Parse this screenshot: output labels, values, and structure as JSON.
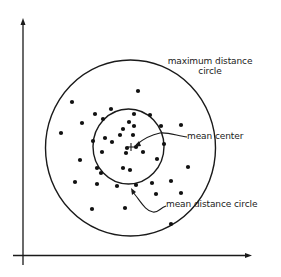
{
  "diagram": {
    "type": "spatial-statistics illustration",
    "axes": {
      "y_axis": {
        "x": 23,
        "top": 18,
        "bottom": 265
      },
      "x_axis": {
        "y": 255.5,
        "left": 13,
        "right": 252
      }
    },
    "outer_circle": {
      "label_line1": "maximum distance",
      "label_line2": "circle",
      "cx": 130.5,
      "cy": 148,
      "rx": 85,
      "ry": 88
    },
    "inner_circle": {
      "label": "mean distance circle",
      "cx": 128.5,
      "cy": 146.5,
      "rx": 35.5,
      "ry": 37.5
    },
    "mean_center": {
      "label": "mean center",
      "x": 131,
      "y": 147
    },
    "labels": {
      "max_circle_line1": "maximum distance",
      "max_circle_line2": "circle",
      "mean_center": "mean center",
      "mean_distance_circle": "mean distance circle"
    },
    "points": [
      [
        72,
        102
      ],
      [
        138,
        91
      ],
      [
        111,
        109
      ],
      [
        82,
        123
      ],
      [
        61,
        133
      ],
      [
        95,
        114
      ],
      [
        103,
        119
      ],
      [
        134,
        114
      ],
      [
        150,
        115
      ],
      [
        129,
        122
      ],
      [
        134,
        126
      ],
      [
        123,
        129
      ],
      [
        120,
        135
      ],
      [
        133,
        135
      ],
      [
        105,
        138
      ],
      [
        112,
        142
      ],
      [
        93,
        141
      ],
      [
        161,
        126
      ],
      [
        181,
        125
      ],
      [
        164,
        144
      ],
      [
        143,
        152
      ],
      [
        157,
        159
      ],
      [
        188,
        167
      ],
      [
        127,
        148
      ],
      [
        136,
        147
      ],
      [
        126,
        153
      ],
      [
        102,
        152
      ],
      [
        80,
        160
      ],
      [
        97,
        168
      ],
      [
        101,
        173
      ],
      [
        123,
        168
      ],
      [
        130,
        170
      ],
      [
        75,
        182
      ],
      [
        97,
        184
      ],
      [
        117,
        186
      ],
      [
        136,
        185
      ],
      [
        152,
        183
      ],
      [
        171,
        181
      ],
      [
        156,
        194
      ],
      [
        181,
        193
      ],
      [
        92,
        209
      ],
      [
        125,
        208
      ],
      [
        171,
        224
      ]
    ]
  }
}
